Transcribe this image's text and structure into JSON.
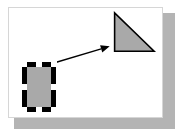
{
  "document": {
    "title": "Shape Diagram",
    "canvas_label": "Drawing canvas",
    "background_color": "#ffffff",
    "border_color": "#d6d6d6",
    "shadow_color": "#b4b4b4"
  },
  "shapes": [
    {
      "id": "rectangle",
      "name": "Rectangle",
      "type": "rectangle",
      "selected": "true",
      "fill_color": "#a9a9a9",
      "stroke_color": "#000000",
      "stroke_width": "5",
      "x": "13",
      "y": "54",
      "width": "34",
      "height": "50",
      "handle_color": "#ffffff",
      "handle_count": "8"
    },
    {
      "id": "triangle",
      "name": "Right Triangle",
      "type": "triangle",
      "selected": "false",
      "fill_color": "#a9a9a9",
      "stroke_color": "#000000",
      "stroke_width": "1.6",
      "points": "115,12 115,51 155,51",
      "x": "115",
      "y": "12",
      "width": "40",
      "height": "39"
    }
  ],
  "connector": {
    "id": "arrow",
    "name": "Arrow connector",
    "type": "arrow",
    "stroke_color": "#000000",
    "stroke_width": "1.4",
    "from_x": "50",
    "from_y": "64",
    "to_x": "110",
    "to_y": "46",
    "arrowhead": "filled-triangle",
    "arrowhead_size": "9"
  },
  "handles": [
    {
      "position": "nw",
      "name": "resize-handle-nw"
    },
    {
      "position": "n",
      "name": "resize-handle-n"
    },
    {
      "position": "ne",
      "name": "resize-handle-ne"
    },
    {
      "position": "w",
      "name": "resize-handle-w"
    },
    {
      "position": "e",
      "name": "resize-handle-e"
    },
    {
      "position": "sw",
      "name": "resize-handle-sw"
    },
    {
      "position": "s",
      "name": "resize-handle-s"
    },
    {
      "position": "se",
      "name": "resize-handle-se"
    }
  ]
}
